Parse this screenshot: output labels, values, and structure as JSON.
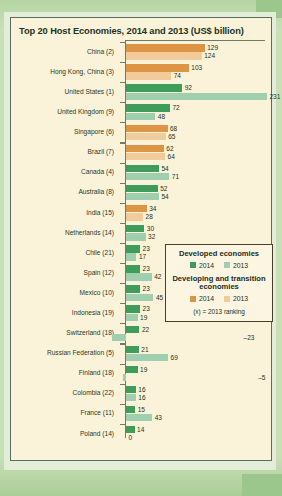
{
  "panel": {
    "title": "Top 20 Host Economies, 2014 and 2013 (US$ billion)"
  },
  "legend": {
    "developed_title": "Developed economies",
    "developing_title": "Developing and transition economies",
    "year_2014": "2014",
    "year_2013": "2013",
    "note": "(x) = 2013 ranking",
    "colors": {
      "developed_2014": "#3f9c5a",
      "developed_2013": "#9fcfae",
      "developing_2014": "#dd9444",
      "developing_2013": "#f2cb9b"
    }
  },
  "chart_data": {
    "type": "bar",
    "title": "Top 20 Host Economies, 2014 and 2013 (US$ billion)",
    "xlabel": "",
    "ylabel": "",
    "orientation": "horizontal",
    "grid": false,
    "legend_position": "inside-right",
    "xlim": [
      -23,
      231
    ],
    "categories": [
      "China (2)",
      "Hong Kong, China (3)",
      "United States (1)",
      "United Kingdom (9)",
      "Singapore (6)",
      "Brazil (7)",
      "Canada (4)",
      "Australia (8)",
      "India (15)",
      "Netherlands (14)",
      "Chile (21)",
      "Spain (12)",
      "Mexico (10)",
      "Indonesia (19)",
      "Switzerland (18)",
      "Russian Federation (5)",
      "Finland (18)",
      "Colombia (22)",
      "France (11)",
      "Poland (14)"
    ],
    "series": [
      {
        "name": "2014",
        "values": [
          129,
          103,
          92,
          72,
          68,
          62,
          54,
          52,
          34,
          30,
          23,
          23,
          23,
          23,
          22,
          21,
          19,
          16,
          15,
          14
        ]
      },
      {
        "name": "2013",
        "values": [
          124,
          74,
          231,
          48,
          65,
          64,
          71,
          54,
          28,
          32,
          17,
          42,
          45,
          19,
          -23,
          69,
          -5,
          16,
          43,
          0
        ]
      }
    ],
    "group": [
      "developing",
      "developing",
      "developed",
      "developed",
      "developing",
      "developing",
      "developed",
      "developed",
      "developing",
      "developed",
      "developed",
      "developed",
      "developed",
      "developed",
      "developed",
      "developed",
      "developed",
      "developed",
      "developed",
      "developed"
    ]
  }
}
